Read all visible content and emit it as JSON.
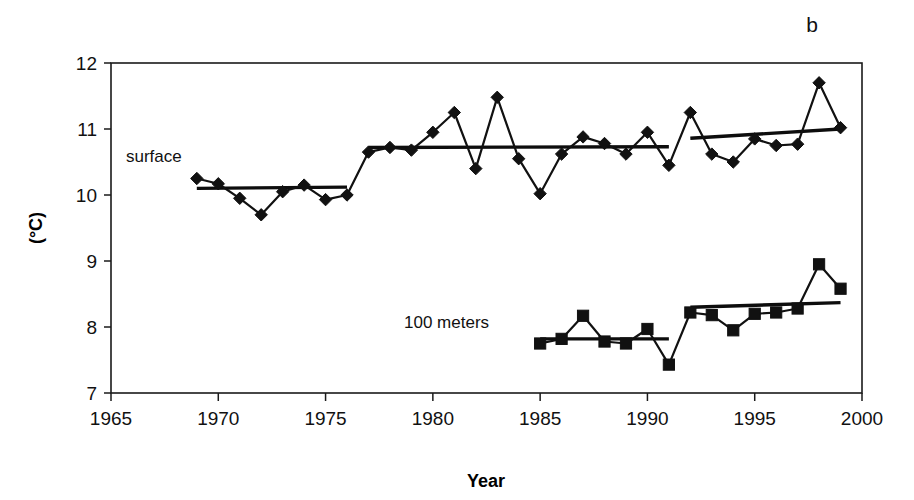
{
  "panel": {
    "label": "b"
  },
  "axes": {
    "x": {
      "title": "Year",
      "ticks": [
        1965,
        1970,
        1975,
        1980,
        1985,
        1990,
        1995,
        2000
      ],
      "tick_labels": [
        "1965",
        "1970",
        "1975",
        "1980",
        "1985",
        "1990",
        "1995",
        "2000"
      ],
      "min": 1965,
      "max": 2000
    },
    "y": {
      "title": "(°C)",
      "ticks": [
        7,
        8,
        9,
        10,
        11,
        12
      ],
      "tick_labels": [
        "7",
        "8",
        "9",
        "10",
        "11",
        "12"
      ],
      "min": 7,
      "max": 12
    }
  },
  "series_labels": {
    "surface": "surface",
    "hundred_meters": "100 meters"
  },
  "chart_data": {
    "type": "line",
    "title": "",
    "xlabel": "Year",
    "ylabel": "(°C)",
    "xlim": [
      1965,
      2000
    ],
    "ylim": [
      7,
      12
    ],
    "grid": false,
    "legend": false,
    "annotations": [
      {
        "text": "b",
        "x": 1998.5,
        "y": 12.6
      },
      {
        "text": "surface",
        "x": 1966.5,
        "y": 10.62
      },
      {
        "text": "100 meters",
        "x": 1979.5,
        "y": 8.12
      }
    ],
    "series": [
      {
        "name": "surface",
        "marker": "diamond",
        "x": [
          1969,
          1970,
          1971,
          1972,
          1973,
          1974,
          1975,
          1976,
          1977,
          1978,
          1979,
          1980,
          1981,
          1982,
          1983,
          1984,
          1985,
          1986,
          1987,
          1988,
          1989,
          1990,
          1991,
          1992,
          1993,
          1994,
          1995,
          1996,
          1997,
          1998,
          1999
        ],
        "values": [
          10.25,
          10.17,
          9.95,
          9.7,
          10.05,
          10.15,
          9.93,
          10.0,
          10.65,
          10.72,
          10.68,
          10.95,
          11.25,
          10.4,
          11.48,
          10.55,
          10.02,
          10.62,
          10.88,
          10.78,
          10.62,
          10.95,
          10.45,
          11.25,
          10.62,
          10.5,
          10.85,
          10.75,
          10.77,
          11.7,
          11.02
        ],
        "trend_segments": [
          {
            "x0": 1969,
            "y0": 10.1,
            "x1": 1976,
            "y1": 10.12
          },
          {
            "x0": 1977,
            "y0": 10.72,
            "x1": 1991,
            "y1": 10.73
          },
          {
            "x0": 1992,
            "y0": 10.86,
            "x1": 1999,
            "y1": 11.0
          }
        ]
      },
      {
        "name": "100 meters",
        "marker": "square",
        "x": [
          1985,
          1986,
          1987,
          1988,
          1989,
          1990,
          1991,
          1992,
          1993,
          1994,
          1995,
          1996,
          1997,
          1998,
          1999
        ],
        "values": [
          7.75,
          7.82,
          8.17,
          7.78,
          7.75,
          7.97,
          7.43,
          8.22,
          8.18,
          7.95,
          8.2,
          8.22,
          8.28,
          8.95,
          8.58
        ],
        "trend_segments": [
          {
            "x0": 1985,
            "y0": 7.82,
            "x1": 1991,
            "y1": 7.82
          },
          {
            "x0": 1992,
            "y0": 8.3,
            "x1": 1999,
            "y1": 8.37
          }
        ]
      }
    ]
  }
}
